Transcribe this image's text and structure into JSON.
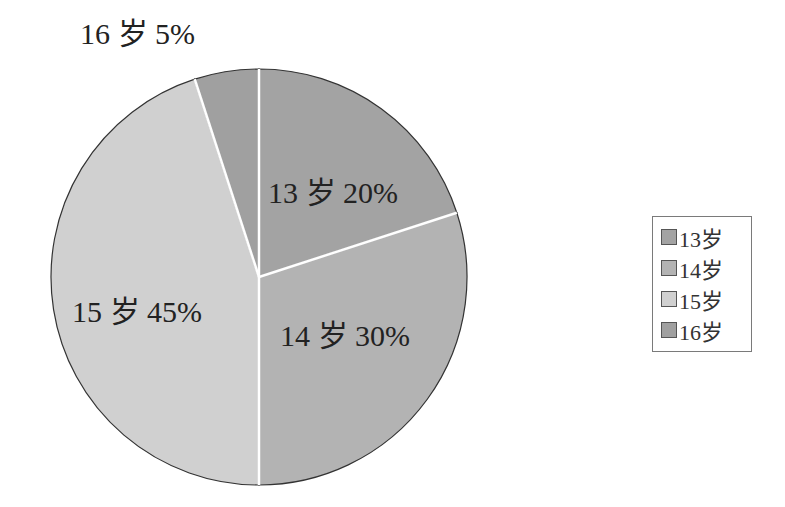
{
  "chart_data": {
    "type": "pie",
    "title": "",
    "categories": [
      "13岁",
      "14岁",
      "15岁",
      "16岁"
    ],
    "values": [
      20,
      30,
      45,
      5
    ],
    "unit": "%",
    "colors": [
      "#a3a3a3",
      "#b3b3b3",
      "#d0d0d0",
      "#a0a0a0"
    ],
    "data_labels": [
      "13 岁 20%",
      "14 岁 30%",
      "15 岁 45%",
      "16 岁 5%"
    ],
    "start_angle_deg": 0,
    "direction": "clockwise",
    "legend_position": "right"
  },
  "legend": {
    "items": [
      {
        "label": "13岁",
        "color": "#a3a3a3"
      },
      {
        "label": "14岁",
        "color": "#b3b3b3"
      },
      {
        "label": "15岁",
        "color": "#d0d0d0"
      },
      {
        "label": "16岁",
        "color": "#a0a0a0"
      }
    ]
  }
}
